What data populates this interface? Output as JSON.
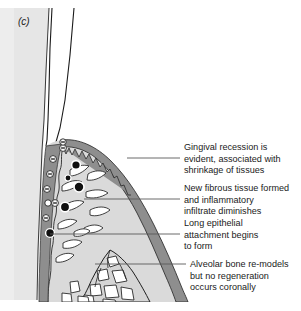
{
  "figure": {
    "panel_label": "(c)",
    "alt_summary": "Histological schematic of periodontal tissue healing after treatment, panel c",
    "colors": {
      "background": "#ffffff",
      "tooth_root": "#e6e6e6",
      "tooth_crown": "#ffffff",
      "connective_tissue": "#dcdcdc",
      "gingival_epithelium": "#8e8e8e",
      "epithelial_attachment": "#8e8e8e",
      "bone_fill": "#d8d8d8",
      "marrow_space": "#ffffff",
      "inflammatory_cell": "#101010",
      "outline": "#1a1a1a",
      "leader_line": "#5a5a5a",
      "text": "#1a1a1a"
    }
  },
  "callouts": [
    {
      "id": "gingival-recession",
      "lines": [
        "Gingival recession is",
        "evident, associated with",
        "shrinkage of tissues"
      ],
      "text_x": 184,
      "text_y": 150,
      "leader": {
        "x1": 127,
        "y1": 158,
        "x2": 180,
        "y2": 158
      }
    },
    {
      "id": "new-fibrous-tissue",
      "lines": [
        "New fibrous tissue formed",
        "and inflammatory",
        "infiltrate diminishes"
      ],
      "text_x": 184,
      "text_y": 191,
      "leader": {
        "x1": 84,
        "y1": 199,
        "x2": 180,
        "y2": 199
      }
    },
    {
      "id": "long-epithelial-attachment",
      "lines": [
        "Long epithelial",
        "attachment begins",
        "to form"
      ],
      "text_x": 184,
      "text_y": 226,
      "leader": {
        "x1": 50,
        "y1": 234,
        "x2": 180,
        "y2": 234
      }
    },
    {
      "id": "alveolar-bone-remodel",
      "lines": [
        "Alveolar bone re-models",
        "but no regeneration",
        "occurs coronally"
      ],
      "text_x": 190,
      "text_y": 263,
      "leader": {
        "x1": 95,
        "y1": 264,
        "x2": 186,
        "y2": 264
      }
    }
  ],
  "anatomy": {
    "tooth_root_label": "tooth-root",
    "tooth_crown_label": "tooth-crown",
    "gingiva_label": "gingival-tissue",
    "epithelium_label": "gingival-epithelium",
    "bone_label": "alveolar-bone",
    "cells_label": "inflammatory-cells",
    "fibroblasts_label": "fibroblasts"
  }
}
